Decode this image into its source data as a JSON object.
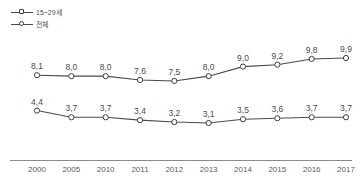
{
  "chart_data": {
    "type": "line",
    "title": "",
    "xlabel": "",
    "ylabel": "",
    "categories": [
      "2000",
      "2005",
      "2010",
      "2011",
      "2012",
      "2013",
      "2014",
      "2015",
      "2016",
      "2017"
    ],
    "series": [
      {
        "name": "15~29세",
        "marker": "square",
        "color": "#4a4a4a",
        "values": [
          8.1,
          8.0,
          8.0,
          7.6,
          7.5,
          8.0,
          9.0,
          9.2,
          9.8,
          9.9
        ],
        "labels": [
          "8,1",
          "8,0",
          "8,0",
          "7,6",
          "7,5",
          "8,0",
          "9,0",
          "9,2",
          "9,8",
          "9,9"
        ]
      },
      {
        "name": "전체",
        "marker": "circle",
        "color": "#4a4a4a",
        "values": [
          4.4,
          3.7,
          3.7,
          3.4,
          3.2,
          3.1,
          3.5,
          3.6,
          3.7,
          3.7
        ],
        "labels": [
          "4,4",
          "3,7",
          "3,7",
          "3,4",
          "3,2",
          "3,1",
          "3,5",
          "3,6",
          "3,7",
          "3,7"
        ]
      }
    ],
    "ylim": [
      0,
      11
    ],
    "grid": false,
    "legend_position": "top-left",
    "axis_color": "#8a8a8a"
  }
}
